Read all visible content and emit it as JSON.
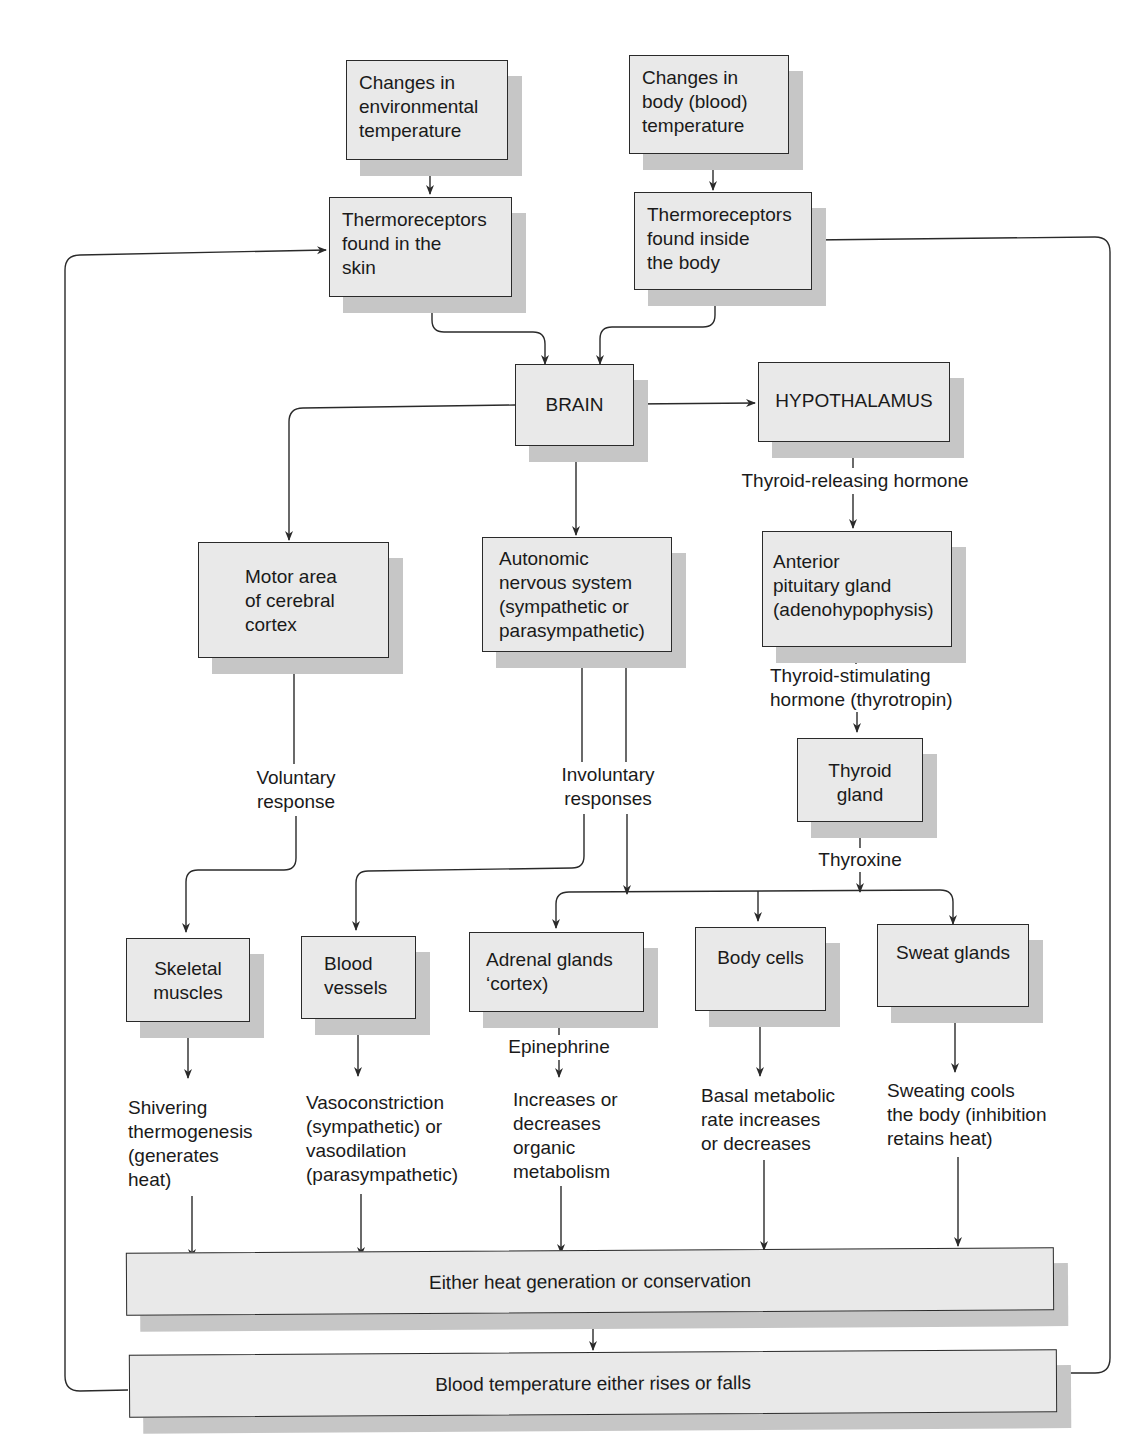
{
  "diagram": {
    "type": "flowchart",
    "nodes": {
      "env_temp": "Changes in\nenvironmental\ntemperature",
      "body_temp": "Changes in\nbody (blood)\ntemperature",
      "skin_receptors": "Thermoreceptors\nfound in the\nskin",
      "body_receptors": "Thermoreceptors\nfound inside\nthe body",
      "brain": "BRAIN",
      "hypothalamus": "HYPOTHALAMUS",
      "motor_cortex": "Motor area\nof cerebral\ncortex",
      "ans": "Autonomic\nnervous system\n(sympathetic or\nparasympathetic)",
      "pituitary": "Anterior\npituitary gland\n(adenohypophysis)",
      "thyroid": "Thyroid\ngland",
      "skeletal": "Skeletal\nmuscles",
      "vessels": "Blood\nvessels",
      "adrenal": "Adrenal glands\n‘cortex)",
      "body_cells": "Body cells",
      "sweat": "Sweat glands",
      "heat_gen": "Either heat generation or conservation",
      "blood_temp": "Blood temperature either rises or falls"
    },
    "labels": {
      "trh": "Thyroid-releasing hormone",
      "tsh": "Thyroid-stimulating\nhormone (thyrotropin)",
      "voluntary": "Voluntary\nresponse",
      "involuntary": "Involuntary\nresponses",
      "thyroxine": "Thyroxine",
      "epinephrine": "Epinephrine",
      "shivering": "Shivering\nthermogenesis\n(generates\nheat)",
      "vaso": "Vasoconstriction\n(sympathetic) or\nvasodilation\n(parasympathetic)",
      "metabolism": "Increases or\ndecreases\norganic\nmetabolism",
      "bmr": "Basal metabolic\nrate increases\nor decreases",
      "sweating": "Sweating cools\nthe body (inhibition\nretains heat)"
    },
    "colors": {
      "box_fill": "#e9e9e9",
      "box_border": "#2a2a2a",
      "shadow": "#c6c6c6",
      "line": "#2a2a2a",
      "background": "#ffffff"
    }
  }
}
